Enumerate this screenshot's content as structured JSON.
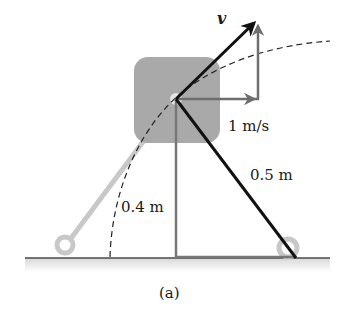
{
  "figure": {
    "caption": "(a)",
    "labels": {
      "velocity": "v",
      "horizontal_speed": "1 m/s",
      "rod_length": "0.5 m",
      "height": "0.4 m"
    },
    "colors": {
      "rod": "#111111",
      "vertical_line": "#777777",
      "component_arrows": "#6e6e6e",
      "block": "#a9a9a9",
      "ghost_rod": "#c8c8c8",
      "ground": "#4a4a4a",
      "dashed_arc": "#222222"
    }
  }
}
